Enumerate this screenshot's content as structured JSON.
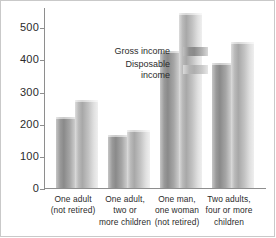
{
  "chart_data": {
    "type": "bar",
    "title": "",
    "subtitle": "",
    "xlabel": "",
    "ylabel": "",
    "ylim": [
      0,
      560
    ],
    "yticks": [
      0,
      100,
      200,
      300,
      400,
      500
    ],
    "ytick_labels": [
      "0",
      "100",
      "200",
      "300",
      "400",
      "500"
    ],
    "grid": false,
    "legend_position": "upper-left-inside",
    "categories": [
      "One adult (not retired)",
      "One adult, two or more children",
      "One man, one woman (not retired)",
      "Two adults, four or more children"
    ],
    "category_lines": [
      [
        "One adult",
        "(not retired)"
      ],
      [
        "One adult,",
        "two or",
        "more children"
      ],
      [
        "One man,",
        "one woman",
        "(not retired)"
      ],
      [
        "Two adults,",
        "four or more",
        "children"
      ]
    ],
    "series": [
      {
        "name": "Gross income",
        "values": [
          220,
          165,
          425,
          390
        ]
      },
      {
        "name": "Disposable income",
        "values": [
          275,
          180,
          545,
          455
        ]
      }
    ],
    "legend": [
      {
        "label": "Gross income",
        "label_lines": [
          "Gross income"
        ],
        "swatch": "swatch-gross"
      },
      {
        "label": "Disposable income",
        "label_lines": [
          "Disposable",
          "income"
        ],
        "swatch": "swatch-disposable"
      }
    ],
    "colors": {
      "gross": "#8a8a8a",
      "disposable": "#b4b4b4",
      "axis": "#8e8e8e",
      "text": "#2b2b2b",
      "background": "#ffffff"
    }
  }
}
